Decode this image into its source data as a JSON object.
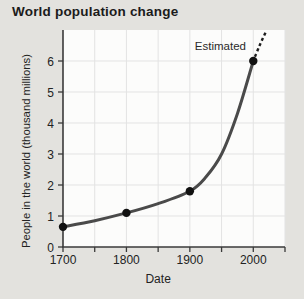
{
  "page": {
    "title": "World population change"
  },
  "chart_data": {
    "type": "line",
    "title": "World population change",
    "xlabel": "Date",
    "ylabel": "People in the world (thousand millions)",
    "annotation": "Estimated",
    "x_range": [
      1700,
      2050
    ],
    "y_range": [
      0,
      7
    ],
    "x_grid_step": 50,
    "x_tick_step": 50,
    "x_tick_labels": [
      "1700",
      "1800",
      "1900",
      "2000"
    ],
    "x_tick_label_years": [
      1700,
      1800,
      1900,
      2000
    ],
    "y_tick_labels": [
      "0",
      "1",
      "2",
      "3",
      "4",
      "5",
      "6"
    ],
    "y_tick_values": [
      0,
      1,
      2,
      3,
      4,
      5,
      6
    ],
    "grid": true,
    "legend": "none",
    "points": [
      [
        1700,
        0.65
      ],
      [
        1800,
        1.1
      ],
      [
        1900,
        1.8
      ],
      [
        2000,
        6.0
      ]
    ],
    "curve_points": [
      [
        1700,
        0.65
      ],
      [
        1750,
        0.85
      ],
      [
        1800,
        1.1
      ],
      [
        1850,
        1.4
      ],
      [
        1900,
        1.8
      ],
      [
        1925,
        2.25
      ],
      [
        1950,
        3.0
      ],
      [
        1975,
        4.3
      ],
      [
        2000,
        6.0
      ]
    ],
    "estimated_points": [
      [
        2000,
        6.0
      ],
      [
        2010,
        6.5
      ],
      [
        2020,
        6.95
      ]
    ],
    "colors": {
      "page_bg": "#e3e2de",
      "plot_bg": "#fcfcfb",
      "grid": "#e3e3e3",
      "axis": "#3a3a3a",
      "line": "#4a4a4a",
      "point": "#111111",
      "text": "#222222",
      "title": "#1b1b1b"
    }
  }
}
